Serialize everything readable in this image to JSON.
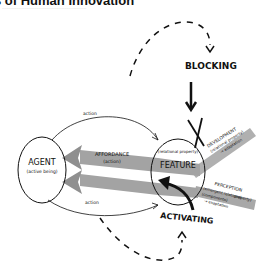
{
  "header": {
    "title": "s of Human Innovation",
    "subtitle": "............................................................................"
  },
  "diagram": {
    "agent": {
      "label": "AGENT",
      "sublabel": "(active being)"
    },
    "feature": {
      "label": "FEATURE",
      "sublabel": "(relational property)"
    },
    "affordance": {
      "label": "AFFORDANCE",
      "sublabel": "(action)"
    },
    "arc_top_label": "action",
    "arc_bottom_label": "action",
    "blocking": {
      "label": "BLOCKING"
    },
    "activating": {
      "label": "ACTIVATING"
    },
    "development": {
      "label": "DEVELOPMENT",
      "line2": "(relational property)",
      "line3": "→ adaptation"
    },
    "perception": {
      "label": "PERCEPTION",
      "line2": "(emergent relational",
      "line3": "property)",
      "line4": "(components)",
      "line5": "→ exaptation"
    },
    "colors": {
      "ink": "#111111",
      "band": "#9a9a9a",
      "band_light": "#b5b5b5"
    }
  }
}
